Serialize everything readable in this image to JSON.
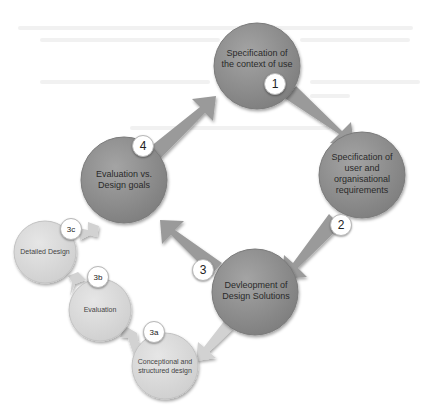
{
  "diagram": {
    "type": "cycle",
    "colors": {
      "main_circle": "#8f8f8f",
      "main_arrow": "#9a9a9a",
      "sub_circle": "#dcdcdc",
      "sub_arrow": "#d2d2d2",
      "badge_bg": "#ffffff"
    },
    "main_nodes": [
      {
        "id": "1",
        "badge": "1",
        "label": "Specification of the context of use"
      },
      {
        "id": "2",
        "badge": "2",
        "label": "Specification of user and organisational requirements"
      },
      {
        "id": "3",
        "badge": "3",
        "label": "Devleopment of Design Solutions"
      },
      {
        "id": "4",
        "badge": "4",
        "label": "Evaluation vs. Design goals"
      }
    ],
    "sub_nodes": [
      {
        "id": "3a",
        "badge": "3a",
        "label": "Conceptional and structured design"
      },
      {
        "id": "3b",
        "badge": "3b",
        "label": "Evaluation"
      },
      {
        "id": "3c",
        "badge": "3c",
        "label": "Detailed Design"
      }
    ],
    "edges": [
      {
        "from": "1",
        "to": "2"
      },
      {
        "from": "2",
        "to": "3"
      },
      {
        "from": "3",
        "to": "4"
      },
      {
        "from": "4",
        "to": "1"
      },
      {
        "from": "3",
        "to": "3a"
      },
      {
        "from": "3a",
        "to": "3b"
      },
      {
        "from": "3b",
        "to": "3c"
      },
      {
        "from": "3c",
        "to": "4"
      }
    ]
  }
}
